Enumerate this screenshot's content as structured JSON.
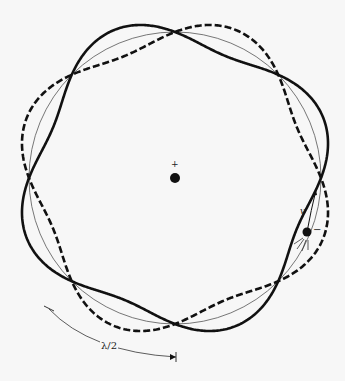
{
  "diagram": {
    "center": {
      "x": 175,
      "y": 178
    },
    "radius": 146,
    "wave_amplitude": 14,
    "nodes": 8,
    "wavelengths_around": 4,
    "labels": {
      "nucleus_charge": "+",
      "electron_charge": "−",
      "velocity": "v",
      "half_wavelength": "λ/2"
    },
    "colors": {
      "line": "#111111",
      "circle": "#555555",
      "background": "#f7f7f7"
    }
  }
}
